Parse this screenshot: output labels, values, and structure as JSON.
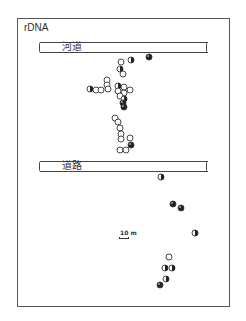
{
  "title": "rDNA",
  "bands": {
    "river": {
      "label": "河道",
      "top": 42
    },
    "road": {
      "label": "道路",
      "top": 161
    }
  },
  "scale": {
    "label": "10 m"
  },
  "legend_types": {
    "open": "open circle",
    "half": "half-filled circle",
    "filled": "mostly filled circle"
  },
  "points": [
    {
      "x": 149,
      "y": 57,
      "t": "filled"
    },
    {
      "x": 121,
      "y": 62,
      "t": "open"
    },
    {
      "x": 131,
      "y": 60,
      "t": "half"
    },
    {
      "x": 120,
      "y": 69,
      "t": "half"
    },
    {
      "x": 123,
      "y": 74,
      "t": "open"
    },
    {
      "x": 107,
      "y": 80,
      "t": "open"
    },
    {
      "x": 107,
      "y": 85,
      "t": "open"
    },
    {
      "x": 90,
      "y": 89,
      "t": "half"
    },
    {
      "x": 96,
      "y": 90,
      "t": "open"
    },
    {
      "x": 101,
      "y": 90,
      "t": "open"
    },
    {
      "x": 108,
      "y": 89,
      "t": "open"
    },
    {
      "x": 118,
      "y": 86,
      "t": "half"
    },
    {
      "x": 124,
      "y": 87,
      "t": "open"
    },
    {
      "x": 118,
      "y": 91,
      "t": "open"
    },
    {
      "x": 124,
      "y": 93,
      "t": "open"
    },
    {
      "x": 130,
      "y": 90,
      "t": "open"
    },
    {
      "x": 120,
      "y": 96,
      "t": "open"
    },
    {
      "x": 124,
      "y": 99,
      "t": "half"
    },
    {
      "x": 123,
      "y": 103,
      "t": "filled"
    },
    {
      "x": 124,
      "y": 107,
      "t": "filled"
    },
    {
      "x": 115,
      "y": 118,
      "t": "open"
    },
    {
      "x": 118,
      "y": 122,
      "t": "open"
    },
    {
      "x": 120,
      "y": 128,
      "t": "open"
    },
    {
      "x": 121,
      "y": 134,
      "t": "open"
    },
    {
      "x": 121,
      "y": 139,
      "t": "open"
    },
    {
      "x": 130,
      "y": 138,
      "t": "open"
    },
    {
      "x": 131,
      "y": 145,
      "t": "filled"
    },
    {
      "x": 120,
      "y": 150,
      "t": "open"
    },
    {
      "x": 126,
      "y": 150,
      "t": "open"
    },
    {
      "x": 161,
      "y": 177,
      "t": "half"
    },
    {
      "x": 173,
      "y": 204,
      "t": "filled"
    },
    {
      "x": 181,
      "y": 208,
      "t": "filled"
    },
    {
      "x": 195,
      "y": 233,
      "t": "half"
    },
    {
      "x": 169,
      "y": 257,
      "t": "open"
    },
    {
      "x": 165,
      "y": 268,
      "t": "half"
    },
    {
      "x": 172,
      "y": 268,
      "t": "half"
    },
    {
      "x": 166,
      "y": 279,
      "t": "half"
    },
    {
      "x": 160,
      "y": 285,
      "t": "filled"
    }
  ]
}
